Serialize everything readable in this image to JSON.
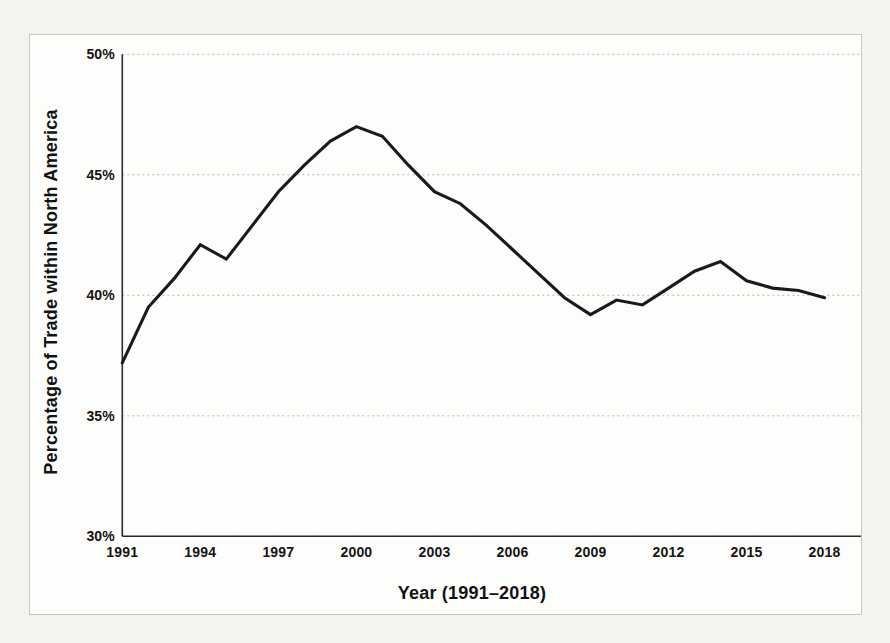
{
  "figure": {
    "kind": "scanned textbook line chart",
    "background": "#f4f3f0",
    "panel_background": "#fdfdfb",
    "panel_border_color": "#c7c6c1"
  },
  "chart_data": {
    "type": "line",
    "title": "",
    "xlabel": "Year (1991–2018)",
    "ylabel": "Percentage of Trade within North America",
    "series_name": "Percentage of trade within North America",
    "x": [
      1991,
      1992,
      1993,
      1994,
      1995,
      1996,
      1997,
      1998,
      1999,
      2000,
      2001,
      2002,
      2003,
      2004,
      2005,
      2006,
      2007,
      2008,
      2009,
      2010,
      2011,
      2012,
      2013,
      2014,
      2015,
      2016,
      2017,
      2018
    ],
    "values": [
      37.2,
      39.5,
      40.7,
      42.1,
      41.5,
      42.9,
      44.3,
      45.4,
      46.4,
      47.0,
      46.6,
      45.4,
      44.3,
      43.8,
      42.9,
      41.9,
      40.9,
      39.9,
      39.2,
      39.8,
      39.6,
      40.3,
      41.0,
      41.4,
      40.6,
      40.3,
      40.2,
      39.9
    ],
    "xlim": [
      1991,
      2019.4
    ],
    "ylim": [
      30,
      50
    ],
    "yticks": {
      "values": [
        50,
        45,
        40,
        35,
        30
      ],
      "labels": [
        "50%",
        "45%",
        "40%",
        "35%",
        "30%"
      ]
    },
    "xticks": {
      "values": [
        1991,
        1994,
        1997,
        2000,
        2003,
        2006,
        2009,
        2012,
        2015,
        2018
      ],
      "labels": [
        "1991",
        "1994",
        "1997",
        "2000",
        "2003",
        "2006",
        "2009",
        "2012",
        "2015",
        "2018"
      ]
    },
    "grid": "horizontal dotted",
    "legend": "none",
    "colors": {
      "line": "#1a1a1a",
      "grid": "#b9b9b4",
      "axis": "#2c2c2c",
      "text": "#141414"
    }
  }
}
